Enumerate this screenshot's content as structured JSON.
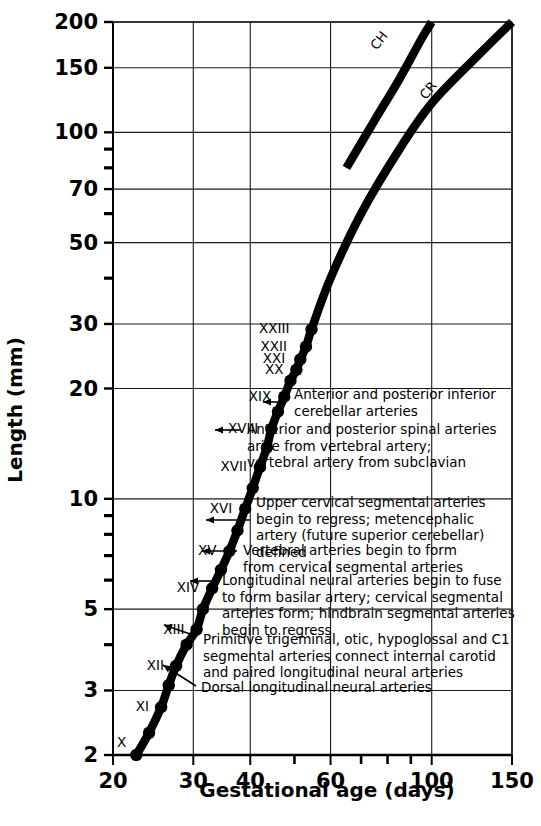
{
  "chart_data": {
    "type": "line",
    "title": "",
    "xlabel": "Gestational age (days)",
    "ylabel": "Length (mm)",
    "xscale": "log",
    "yscale": "log",
    "xlim": [
      20,
      150
    ],
    "ylim": [
      2,
      200
    ],
    "grid": true,
    "legend_position": "inline-on-curve",
    "xticks": [
      {
        "value": 20,
        "label": "20",
        "major": true
      },
      {
        "value": 30,
        "label": "30",
        "major": true
      },
      {
        "value": 40,
        "label": "40",
        "major": true
      },
      {
        "value": 50,
        "label": "",
        "major": false
      },
      {
        "value": 60,
        "label": "60",
        "major": true
      },
      {
        "value": 70,
        "label": "",
        "major": false
      },
      {
        "value": 80,
        "label": "",
        "major": false
      },
      {
        "value": 90,
        "label": "",
        "major": false
      },
      {
        "value": 100,
        "label": "100",
        "major": true
      },
      {
        "value": 150,
        "label": "150",
        "major": true
      }
    ],
    "yticks": [
      {
        "value": 200,
        "label": "200",
        "major": true
      },
      {
        "value": 150,
        "label": "150",
        "major": true
      },
      {
        "value": 100,
        "label": "100",
        "major": true
      },
      {
        "value": 90,
        "label": "",
        "major": false
      },
      {
        "value": 80,
        "label": "",
        "major": false
      },
      {
        "value": 70,
        "label": "70",
        "major": true
      },
      {
        "value": 60,
        "label": "",
        "major": false
      },
      {
        "value": 50,
        "label": "50",
        "major": true
      },
      {
        "value": 40,
        "label": "",
        "major": false
      },
      {
        "value": 30,
        "label": "30",
        "major": true
      },
      {
        "value": 20,
        "label": "20",
        "major": true
      },
      {
        "value": 10,
        "label": "10",
        "major": true
      },
      {
        "value": 9,
        "label": "",
        "major": false
      },
      {
        "value": 8,
        "label": "",
        "major": false
      },
      {
        "value": 7,
        "label": "",
        "major": false
      },
      {
        "value": 6,
        "label": "",
        "major": false
      },
      {
        "value": 5,
        "label": "5",
        "major": true
      },
      {
        "value": 4,
        "label": "",
        "major": false
      },
      {
        "value": 3,
        "label": "3",
        "major": true
      },
      {
        "value": 2,
        "label": "2",
        "major": true
      }
    ],
    "series": [
      {
        "name": "CR",
        "label": "CR",
        "label_x": 100,
        "label_y": 128,
        "label_rotation": -52,
        "description": "Crown-rump length curve with Carnegie stage markers",
        "points": [
          {
            "x": 22.5,
            "y": 2.0,
            "stage": "X"
          },
          {
            "x": 24.0,
            "y": 2.3,
            "stage": ""
          },
          {
            "x": 25.5,
            "y": 2.7,
            "stage": "XI"
          },
          {
            "x": 26.5,
            "y": 3.1,
            "stage": ""
          },
          {
            "x": 27.5,
            "y": 3.5,
            "stage": "XII"
          },
          {
            "x": 29.0,
            "y": 4.0,
            "stage": ""
          },
          {
            "x": 30.5,
            "y": 4.4,
            "stage": "XIII"
          },
          {
            "x": 31.5,
            "y": 5.0,
            "stage": ""
          },
          {
            "x": 33.0,
            "y": 5.7,
            "stage": "XIV"
          },
          {
            "x": 34.5,
            "y": 6.4,
            "stage": ""
          },
          {
            "x": 36.0,
            "y": 7.2,
            "stage": "XV"
          },
          {
            "x": 37.5,
            "y": 8.2,
            "stage": ""
          },
          {
            "x": 39.0,
            "y": 9.4,
            "stage": "XVI"
          },
          {
            "x": 40.5,
            "y": 10.7,
            "stage": ""
          },
          {
            "x": 42.0,
            "y": 12.2,
            "stage": "XVII"
          },
          {
            "x": 43.5,
            "y": 13.8,
            "stage": ""
          },
          {
            "x": 44.5,
            "y": 15.5,
            "stage": "XVIII"
          },
          {
            "x": 46.0,
            "y": 17.3,
            "stage": ""
          },
          {
            "x": 47.5,
            "y": 19.0,
            "stage": "XIX"
          },
          {
            "x": 49.0,
            "y": 21.0,
            "stage": ""
          },
          {
            "x": 50.5,
            "y": 22.5,
            "stage": "XX"
          },
          {
            "x": 51.5,
            "y": 24.0,
            "stage": "XXI"
          },
          {
            "x": 53.0,
            "y": 26.0,
            "stage": "XXII"
          },
          {
            "x": 54.5,
            "y": 29.0,
            "stage": "XXIII"
          },
          {
            "x": 60.0,
            "y": 40.0,
            "stage": ""
          },
          {
            "x": 70.0,
            "y": 60.0,
            "stage": ""
          },
          {
            "x": 85.0,
            "y": 90.0,
            "stage": ""
          },
          {
            "x": 100.0,
            "y": 120.0,
            "stage": ""
          },
          {
            "x": 125.0,
            "y": 160.0,
            "stage": ""
          },
          {
            "x": 150.0,
            "y": 200.0,
            "stage": ""
          }
        ]
      },
      {
        "name": "CH",
        "label": "CH",
        "label_x": 78,
        "label_y": 175,
        "label_rotation": -52,
        "description": "Crown-heel length curve, begins at about day 65",
        "points": [
          {
            "x": 65.0,
            "y": 80.0,
            "stage": ""
          },
          {
            "x": 75.0,
            "y": 108.0,
            "stage": ""
          },
          {
            "x": 85.0,
            "y": 140.0,
            "stage": ""
          },
          {
            "x": 95.0,
            "y": 180.0,
            "stage": ""
          },
          {
            "x": 100.0,
            "y": 200.0,
            "stage": ""
          }
        ]
      }
    ],
    "stage_markers": [
      {
        "label": "X",
        "x": 22.5,
        "y": 2.0
      },
      {
        "label": "XI",
        "x": 25.5,
        "y": 2.7
      },
      {
        "label": "XII",
        "x": 27.5,
        "y": 3.5
      },
      {
        "label": "XIII",
        "x": 30.5,
        "y": 4.4
      },
      {
        "label": "XIV",
        "x": 33.0,
        "y": 5.7
      },
      {
        "label": "XV",
        "x": 36.0,
        "y": 7.2
      },
      {
        "label": "XVI",
        "x": 39.0,
        "y": 9.4
      },
      {
        "label": "XVII",
        "x": 42.0,
        "y": 12.2
      },
      {
        "label": "XVIII",
        "x": 44.5,
        "y": 15.5
      },
      {
        "label": "XIX",
        "x": 47.5,
        "y": 19.0
      },
      {
        "label": "XX",
        "x": 50.5,
        "y": 22.5
      },
      {
        "label": "XXI",
        "x": 51.5,
        "y": 24.0
      },
      {
        "label": "XXII",
        "x": 53.0,
        "y": 26.0
      },
      {
        "label": "XXIII",
        "x": 54.5,
        "y": 29.0
      }
    ],
    "annotations": [
      {
        "id": "annot-xix",
        "stage": "XIX",
        "lines": [
          "Anterior and posterior inferior",
          "   cerebellar arteries"
        ]
      },
      {
        "id": "annot-xviii",
        "stage": "XVIII",
        "lines": [
          "Anterior and posterior spinal arteries",
          "   arise from vertebral artery;",
          "   vertebral artery from subclavian"
        ]
      },
      {
        "id": "annot-xvi",
        "stage": "XVI",
        "lines": [
          "Upper cervical segmental arteries",
          "begin to regress; metencephalic",
          "   artery (future superior cerebellar)",
          "   defined"
        ]
      },
      {
        "id": "annot-xv",
        "stage": "XV",
        "lines": [
          "Vertebral arteries begin to form",
          "   from cervical segmental arteries"
        ]
      },
      {
        "id": "annot-xiv",
        "stage": "XIV",
        "lines": [
          "Longitudinal neural arteries begin to fuse",
          "   to form basilar artery; cervical segmental",
          "   arteries form;  hindbrain segmental arteries",
          "   begin to regress"
        ]
      },
      {
        "id": "annot-xiii",
        "stage": "XIII",
        "lines": [
          "Primitive trigeminal, otic, hypoglossal and C1",
          "  segmental arteries connect internal carotid",
          "  and paired longitudinal neural arteries"
        ]
      },
      {
        "id": "annot-xii",
        "stage": "XII",
        "lines": [
          "Dorsal longitudinal neural arteries"
        ]
      }
    ]
  },
  "caption": ""
}
